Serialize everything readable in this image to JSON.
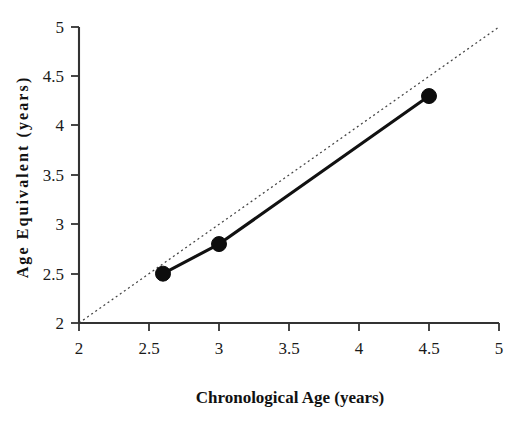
{
  "chart_data": {
    "type": "line",
    "title": "",
    "subtitle": "",
    "xlabel": "Chronological Age (years)",
    "ylabel": "Age Equivalent (years)",
    "xlim": [
      2,
      5
    ],
    "ylim": [
      2,
      5
    ],
    "xticks": [
      2,
      2.5,
      3,
      3.5,
      4,
      4.5,
      5
    ],
    "xtick_labels": [
      "2",
      "2.5",
      "3",
      "3.5",
      "4",
      "4.5",
      "5"
    ],
    "yticks": [
      2,
      2.5,
      3,
      3.5,
      4,
      4.5,
      5
    ],
    "ytick_labels": [
      "2",
      "2.5",
      "3",
      "3.5",
      "4",
      "4.5",
      "5"
    ],
    "grid": false,
    "legend": false,
    "legend_position": "none",
    "series": [
      {
        "name": "Age Equivalent",
        "style": "solid-line-with-filled-circle-markers",
        "color": "#111111",
        "x": [
          2.6,
          3.0,
          4.5
        ],
        "y": [
          2.5,
          2.8,
          4.3
        ]
      },
      {
        "name": "Identity reference line",
        "style": "dotted",
        "color": "#444444",
        "x": [
          2,
          5
        ],
        "y": [
          2,
          5
        ]
      }
    ],
    "annotations": []
  },
  "axes": {
    "x_axis_name": "x-axis",
    "y_axis_name": "y-axis"
  },
  "colors": {
    "line": "#111111",
    "marker": "#0d0d0d",
    "reference": "#444444",
    "axis": "#333333",
    "text": "#111111",
    "background": "#ffffff"
  }
}
